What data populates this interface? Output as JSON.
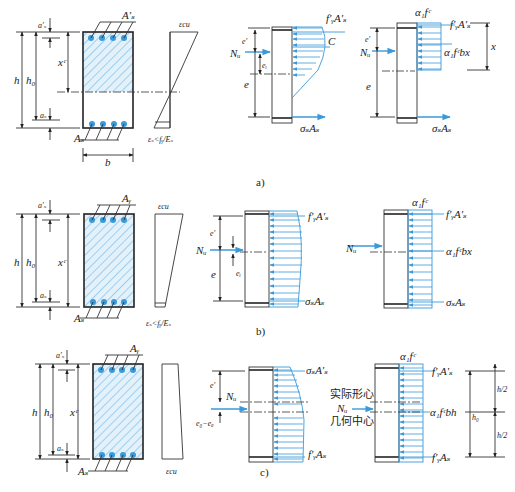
{
  "figure": {
    "caption": "",
    "panels": [
      {
        "id": "a",
        "label": "a)",
        "section": {
          "dims": {
            "h": "h",
            "h0": "h₀",
            "xc": "xᶜ",
            "as_top": "a′ₛ",
            "as_bot": "aₛ",
            "b": "b"
          },
          "steel_top": "A′ₛ",
          "steel_bot": "Aₛ",
          "strain_top": "εcu",
          "strain_bot": "εₛ<fᵧ/Eₛ"
        },
        "actual_stress": {
          "load": "Nᵤ",
          "ecc": [
            "e′",
            "eᵢ",
            "e"
          ],
          "forces": [
            "f′ᵧA′ₛ",
            "C",
            "σₛAₛ"
          ]
        },
        "equivalent_stress": {
          "load": "Nᵤ",
          "ecc": [
            "e′",
            "e"
          ],
          "top": "α₁fᶜ",
          "forces": [
            "f′ᵧA′ₛ",
            "α₁fᶜbx",
            "σₛAₛ"
          ],
          "depth": "x"
        }
      },
      {
        "id": "b",
        "label": "b)",
        "section": {
          "dims": {
            "h": "h",
            "h0": "h₀",
            "xc": "xᶜ",
            "as_top": "a′ₛ",
            "as_bot": "aₛ"
          },
          "steel_top": "Aᵧ",
          "steel_bot": "Aₛ",
          "strain_top": "εcu",
          "strain_bot": "εₛ<fᵧ/Eₛ"
        },
        "actual_stress": {
          "load": "Nᵤ",
          "ecc": [
            "e′",
            "eᵢ",
            "e"
          ],
          "forces": [
            "f′ᵧA′ₛ",
            "σₛAₛ"
          ]
        },
        "equivalent_stress": {
          "load": "Nᵤ",
          "top": "α₁fᶜ",
          "forces": [
            "f′ᵧA′ₛ",
            "α₁fᶜbx",
            "σₛAₛ"
          ]
        }
      },
      {
        "id": "c",
        "label": "c)",
        "section": {
          "dims": {
            "h": "h",
            "h0": "h₀",
            "xc": "xᶜ",
            "as_top": "a′ₛ",
            "as_bot": "aₛ"
          },
          "steel_top": "Aᵧ",
          "steel_bot": "Aₛ",
          "strain_bot": "εcu"
        },
        "actual_stress": {
          "load": "Nᵤ",
          "ecc": [
            "e′",
            "e₀−eₐ"
          ],
          "forces": [
            "σₛA′ₛ",
            "f′ᵧAₛ"
          ]
        },
        "equivalent_stress": {
          "load": "Nᵤ",
          "top": "α₁fᶜ",
          "centroid_actual": "实际形心",
          "centroid_geometric": "几何中心",
          "forces": [
            "f′ᵧA′ₛ",
            "α₁fᶜbh",
            "f′ᵧAₛ"
          ],
          "dims": [
            "h/2",
            "h/2",
            "h₀"
          ]
        }
      }
    ]
  },
  "colors": {
    "accent": "#3a9ad9",
    "ink": "#222222",
    "hatch": "#3a9ad9"
  }
}
